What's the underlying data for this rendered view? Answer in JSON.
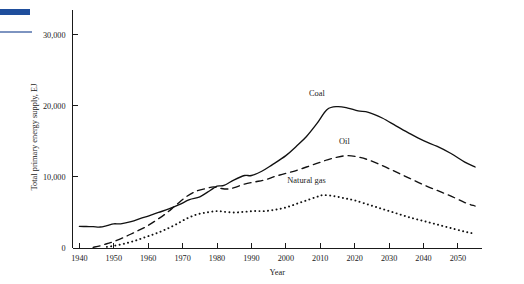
{
  "figure": {
    "artifacts": [
      {
        "name": "blue-rule-thick",
        "color": "#1F4E9C"
      },
      {
        "name": "blue-rule-thin",
        "color": "#7D94C0"
      }
    ]
  },
  "chart_data": {
    "type": "line",
    "title": "",
    "xlabel": "Year",
    "ylabel": "Total primary energy supply, EJ",
    "xlim": [
      1938,
      2057
    ],
    "ylim": [
      0,
      33500
    ],
    "grid": false,
    "legend_position": "inline-annotations",
    "xticks": [
      1940,
      1950,
      1960,
      1970,
      1980,
      1990,
      2000,
      2010,
      2020,
      2030,
      2040,
      2050
    ],
    "xtick_labels": [
      "1940",
      "1950",
      "1960",
      "1970",
      "1980",
      "1990",
      "2000",
      "2010",
      "2020",
      "2030",
      "2040",
      "2050"
    ],
    "yticks": [
      0,
      10000,
      20000,
      30000
    ],
    "ytick_labels": [
      "0",
      "10,000",
      "20,000",
      "30,000"
    ],
    "series": [
      {
        "name": "Coal",
        "label": "Coal",
        "style": "solid",
        "color": "#111111",
        "x": [
          1940,
          1942,
          1944,
          1946,
          1948,
          1950,
          1952,
          1955,
          1958,
          1960,
          1963,
          1966,
          1969,
          1972,
          1975,
          1978,
          1980,
          1982,
          1985,
          1988,
          1990,
          1993,
          1996,
          2000,
          2003,
          2006,
          2009,
          2012,
          2015,
          2018,
          2021,
          2024,
          2028,
          2032,
          2036,
          2040,
          2044,
          2048,
          2052,
          2055
        ],
        "values": [
          3050,
          3020,
          3000,
          2950,
          3150,
          3400,
          3400,
          3700,
          4200,
          4500,
          5000,
          5500,
          6100,
          6800,
          7200,
          8100,
          8700,
          8800,
          9600,
          10200,
          10200,
          10800,
          11700,
          13000,
          14300,
          15700,
          17500,
          19500,
          19900,
          19700,
          19300,
          19100,
          18300,
          17200,
          16100,
          15100,
          14300,
          13300,
          12100,
          11400
        ]
      },
      {
        "name": "Oil",
        "label": "Oil",
        "style": "dashed",
        "color": "#111111",
        "x": [
          1944,
          1946,
          1948,
          1950,
          1953,
          1956,
          1959,
          1962,
          1965,
          1968,
          1971,
          1974,
          1977,
          1979,
          1981,
          1983,
          1985,
          1988,
          1991,
          1994,
          1997,
          2000,
          2003,
          2006,
          2009,
          2012,
          2015,
          2018,
          2021,
          2024,
          2028,
          2032,
          2036,
          2040,
          2044,
          2048,
          2052,
          2055
        ],
        "values": [
          100,
          300,
          600,
          900,
          1500,
          2200,
          2900,
          3800,
          4800,
          6000,
          7200,
          8000,
          8400,
          8600,
          8400,
          8300,
          8500,
          9000,
          9300,
          9600,
          10100,
          10500,
          10900,
          11400,
          11900,
          12400,
          12800,
          13000,
          12800,
          12400,
          11600,
          10700,
          9800,
          8900,
          8100,
          7300,
          6400,
          5900
        ]
      },
      {
        "name": "Natural gas",
        "label": "Natural gas",
        "style": "dotted",
        "color": "#111111",
        "x": [
          1948,
          1950,
          1953,
          1956,
          1959,
          1962,
          1965,
          1968,
          1971,
          1974,
          1977,
          1980,
          1982,
          1985,
          1988,
          1991,
          1994,
          1997,
          2000,
          2003,
          2006,
          2009,
          2011,
          2014,
          2017,
          2020,
          2024,
          2028,
          2032,
          2036,
          2040,
          2044,
          2048,
          2052,
          2055
        ],
        "values": [
          150,
          300,
          600,
          1000,
          1500,
          2000,
          2600,
          3300,
          4100,
          4700,
          5000,
          5200,
          5100,
          5000,
          5100,
          5200,
          5200,
          5400,
          5700,
          6200,
          6700,
          7200,
          7450,
          7300,
          7000,
          6700,
          6100,
          5500,
          4900,
          4300,
          3800,
          3300,
          2800,
          2300,
          2000
        ]
      }
    ]
  }
}
